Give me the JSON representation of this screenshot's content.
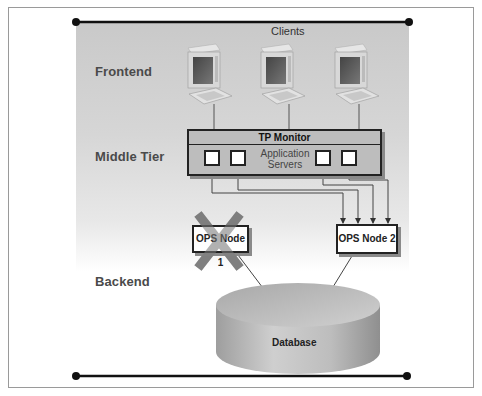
{
  "diagram": {
    "tiers": {
      "frontend": "Frontend",
      "middle": "Middle Tier",
      "backend": "Backend"
    },
    "clients_label": "Clients",
    "client_count": 3,
    "tp_monitor": {
      "title": "TP Monitor",
      "app_servers_label_line1": "Application",
      "app_servers_label_line2": "Servers",
      "app_server_count": 4
    },
    "nodes": [
      {
        "label": "OPS Node 1",
        "status": "failed",
        "marker": "X"
      },
      {
        "label": "OPS Node 2",
        "status": "active"
      }
    ],
    "database": {
      "label": "Database"
    },
    "colors": {
      "panel": "#c9c9c9",
      "failure_x": "#7a7a7a",
      "line": "#333333",
      "box_border": "#222222"
    }
  }
}
